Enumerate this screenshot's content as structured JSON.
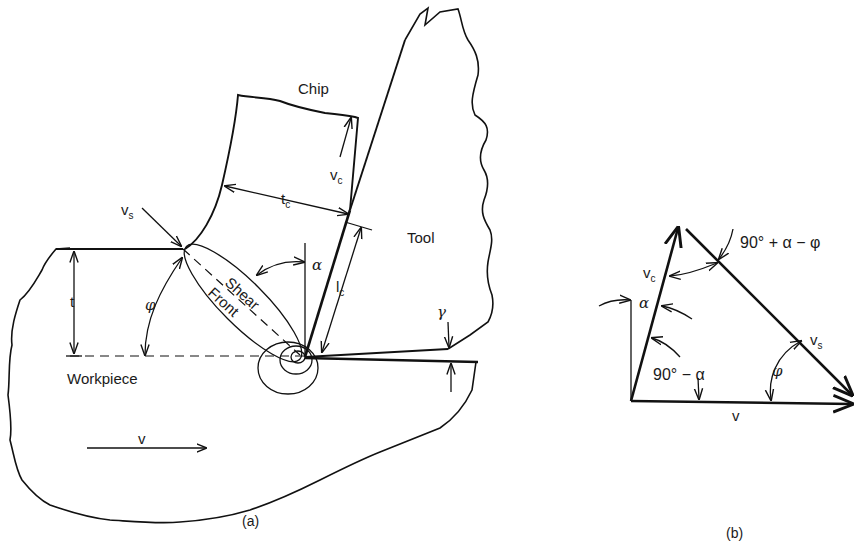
{
  "figure_a": {
    "caption": "(a)",
    "labels": {
      "chip": "Chip",
      "tool": "Tool",
      "workpiece": "Workpiece",
      "shear": "Shear",
      "front": "Front",
      "vc_main": "v",
      "vc_sub": "c",
      "vs_main": "v",
      "vs_sub": "s",
      "tc_main": "t",
      "tc_sub": "c",
      "lc_main": "l",
      "lc_sub": "c",
      "t": "t",
      "v": "v",
      "alpha": "α",
      "phi": "φ",
      "gamma": "γ"
    }
  },
  "figure_b": {
    "caption": "(b)",
    "labels": {
      "vc_main": "v",
      "vc_sub": "c",
      "vs_main": "v",
      "vs_sub": "s",
      "v": "v",
      "alpha": "α",
      "phi": "φ",
      "angle_top": "90° + α − φ",
      "angle_left": "90° − α"
    }
  },
  "colors": {
    "ink": "#111111",
    "background": "#ffffff"
  }
}
